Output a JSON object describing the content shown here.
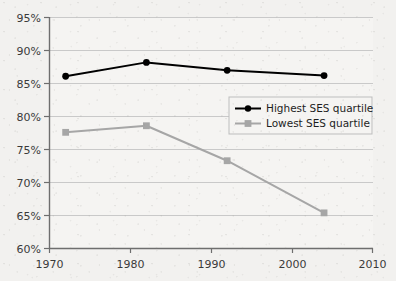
{
  "chart_data": {
    "type": "line",
    "title": "",
    "subtitle": "",
    "xlabel": "",
    "ylabel": "",
    "xlim": [
      1970,
      2010
    ],
    "ylim": [
      60,
      95
    ],
    "grid": true,
    "grid_axis": "y",
    "legend_position": "inside-right-upper",
    "x": [
      1972,
      1982,
      1992,
      2004
    ],
    "x_tick_labels": [
      "1970",
      "1980",
      "1990",
      "2000",
      "2010"
    ],
    "x_ticks": [
      1970,
      1980,
      1990,
      2000,
      2010
    ],
    "y_tick_labels": [
      "60%",
      "65%",
      "70%",
      "75%",
      "80%",
      "85%",
      "90%",
      "95%"
    ],
    "y_ticks": [
      60,
      65,
      70,
      75,
      80,
      85,
      90,
      95
    ],
    "series": [
      {
        "name": "Highest SES quartile",
        "color": "#000000",
        "marker": "circle",
        "values": [
          86.1,
          88.2,
          87.0,
          86.2
        ]
      },
      {
        "name": "Lowest SES quartile",
        "color": "#a6a6a6",
        "marker": "square",
        "values": [
          77.6,
          78.6,
          73.3,
          65.4
        ]
      }
    ]
  },
  "legend": {
    "items": [
      {
        "label": "Highest SES quartile",
        "color": "#000000",
        "marker": "circle"
      },
      {
        "label": "Lowest SES quartile",
        "color": "#a6a6a6",
        "marker": "square"
      }
    ]
  },
  "axes": {
    "y_labels": [
      "95%",
      "90%",
      "85%",
      "80%",
      "75%",
      "70%",
      "65%",
      "60%"
    ],
    "x_labels": [
      "1970",
      "1980",
      "1990",
      "2000",
      "2010"
    ]
  },
  "colors": {
    "background": "#f2f1ef",
    "axis": "#6e6e6e",
    "gridline": "#c9c9c9",
    "series_high": "#000000",
    "series_low": "#a6a6a6",
    "text": "#3a3a3a"
  }
}
